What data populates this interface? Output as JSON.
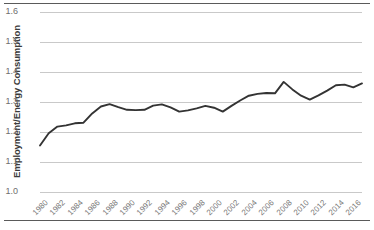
{
  "figure": {
    "name": "employment-energy-consumption-line-chart",
    "top_rule": "",
    "bottom_rule": ""
  },
  "chart_data": {
    "type": "line",
    "title": "",
    "xlabel": "",
    "ylabel": "Employment/Energy Consumption",
    "ylim": [
      1.0,
      1.6
    ],
    "xlim": [
      1980,
      2017
    ],
    "grid": true,
    "legend": null,
    "line_color": "#333333",
    "gridline_color": "#c9c9c9",
    "ytick_labels": [
      "1.6",
      "1.5",
      "1.4",
      "1.3",
      "1.2",
      "1.1",
      "1.0"
    ],
    "ytick_values": [
      1.6,
      1.5,
      1.4,
      1.3,
      1.2,
      1.1,
      1.0
    ],
    "xtick_labels": [
      "1980",
      "1982",
      "1984",
      "1986",
      "1988",
      "1990",
      "1992",
      "1994",
      "1996",
      "1998",
      "2000",
      "2002",
      "2004",
      "2006",
      "2008",
      "2010",
      "2012",
      "2014",
      "2016"
    ],
    "xtick_values": [
      1980,
      1982,
      1984,
      1986,
      1988,
      1990,
      1992,
      1994,
      1996,
      1998,
      2000,
      2002,
      2004,
      2006,
      2008,
      2010,
      2012,
      2014,
      2016
    ],
    "x": [
      1980,
      1981,
      1982,
      1983,
      1984,
      1985,
      1986,
      1987,
      1988,
      1989,
      1990,
      1991,
      1992,
      1993,
      1994,
      1995,
      1996,
      1997,
      1998,
      1999,
      2000,
      2001,
      2002,
      2003,
      2004,
      2005,
      2006,
      2007,
      2008,
      2009,
      2010,
      2011,
      2012,
      2013,
      2014,
      2015,
      2016,
      2017
    ],
    "values": [
      1.155,
      1.196,
      1.218,
      1.222,
      1.229,
      1.231,
      1.262,
      1.285,
      1.293,
      1.283,
      1.274,
      1.273,
      1.274,
      1.288,
      1.292,
      1.282,
      1.268,
      1.272,
      1.279,
      1.287,
      1.281,
      1.268,
      1.287,
      1.305,
      1.321,
      1.327,
      1.33,
      1.329,
      1.367,
      1.342,
      1.321,
      1.308,
      1.322,
      1.338,
      1.356,
      1.358,
      1.349,
      1.362
    ],
    "series_name": "Employment/Energy Consumption"
  }
}
